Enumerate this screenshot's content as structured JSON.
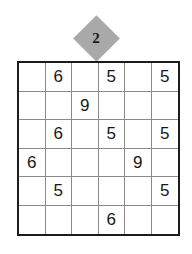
{
  "badge": {
    "icon": "diamond-badge",
    "value": "2",
    "fill_color": "#a9a9a9",
    "text_color": "#191919"
  },
  "grid": {
    "rows": 6,
    "columns": 6,
    "border_color": "#1c1c1c",
    "line_color": "#8a8a8a",
    "background": "#ffffff",
    "digit_color": "#171717",
    "cells": [
      [
        "",
        "6",
        "",
        "5",
        "",
        "5"
      ],
      [
        "",
        "",
        "9",
        "",
        "",
        ""
      ],
      [
        "",
        "6",
        "",
        "5",
        "",
        "5"
      ],
      [
        "6",
        "",
        "",
        "",
        "9",
        ""
      ],
      [
        "",
        "5",
        "",
        "",
        "",
        "5"
      ],
      [
        "",
        "",
        "",
        "6",
        "",
        ""
      ]
    ]
  }
}
